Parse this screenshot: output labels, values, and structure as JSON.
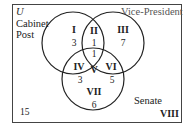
{
  "diagram": {
    "universe_label": "U",
    "sets": [
      {
        "id": "cabinet",
        "label_lines": [
          "Cabinet",
          "Post"
        ]
      },
      {
        "id": "vice_president",
        "label_lines": [
          "Vice-President"
        ]
      },
      {
        "id": "senate",
        "label_lines": [
          "Senate"
        ]
      }
    ],
    "regions": [
      {
        "roman": "I",
        "count": "3"
      },
      {
        "roman": "II",
        "count": "1"
      },
      {
        "roman": "III",
        "count": "7"
      },
      {
        "roman": "IV",
        "count": "3"
      },
      {
        "roman": "V",
        "count": "1"
      },
      {
        "roman": "VI",
        "count": "5"
      },
      {
        "roman": "VII",
        "count": "6"
      },
      {
        "roman": "VIII",
        "count": "15"
      }
    ]
  }
}
